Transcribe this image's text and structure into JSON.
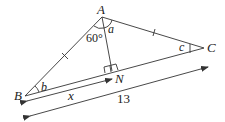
{
  "figure": {
    "points": {
      "A": "A",
      "B": "B",
      "C": "C",
      "N": "N"
    },
    "angles": {
      "at_A_left": "60°",
      "at_A_right": "a",
      "at_B": "b",
      "at_C": "c"
    },
    "lengths": {
      "BN": "x",
      "BC": "13"
    },
    "equal_marks": [
      "AB",
      "AC"
    ],
    "right_angle_at": "N"
  }
}
